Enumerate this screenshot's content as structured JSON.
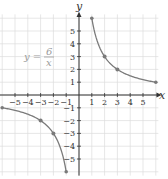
{
  "chart_data": {
    "type": "line",
    "title": "",
    "equation": {
      "lhs": "y =",
      "numerator": "6",
      "denominator": "x"
    },
    "xlabel": "x",
    "ylabel": "y",
    "xlim": [
      -6,
      6
    ],
    "ylim": [
      -6,
      6
    ],
    "x_ticks": [
      -5,
      -4,
      -3,
      -2,
      -1,
      1,
      2,
      3,
      4,
      5
    ],
    "y_ticks": [
      -5,
      -4,
      -3,
      -2,
      -1,
      1,
      2,
      3,
      4,
      5
    ],
    "grid": true,
    "series": [
      {
        "name": "y = 6/x (x > 0)",
        "points": [
          [
            1,
            6
          ],
          [
            2,
            3
          ],
          [
            3,
            2
          ],
          [
            6,
            1
          ]
        ],
        "marked_points": [
          [
            2,
            3
          ],
          [
            3,
            2
          ]
        ]
      },
      {
        "name": "y = 6/x (x < 0)",
        "points": [
          [
            -6,
            -1
          ],
          [
            -3,
            -2
          ],
          [
            -2,
            -3
          ],
          [
            -1,
            -6
          ]
        ],
        "marked_points": [
          [
            -3,
            -2
          ],
          [
            -2,
            -3
          ]
        ]
      }
    ]
  },
  "style": {
    "curve_color": "#7a7a7a",
    "axis_color": "#333333",
    "grid_color": "#dddddd",
    "equation_color": "#9a9a9a"
  }
}
